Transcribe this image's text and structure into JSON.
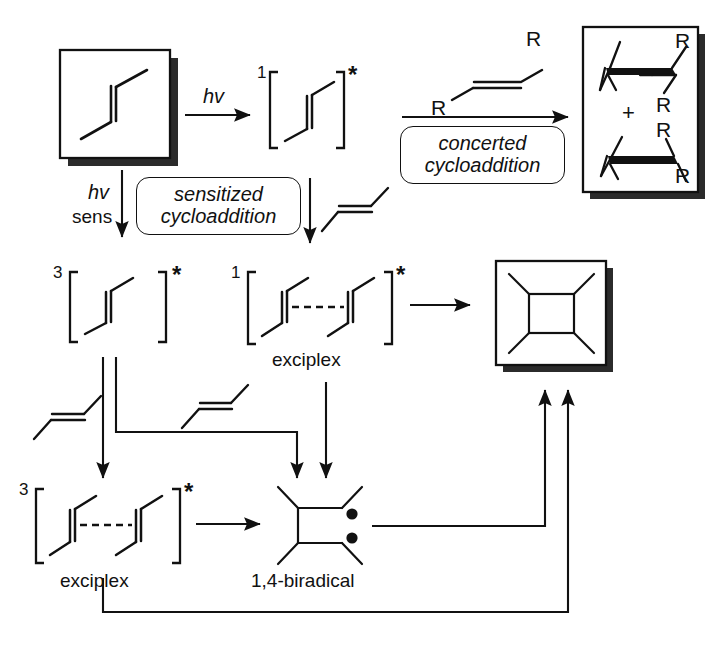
{
  "scheme": {
    "title": "Photochemical [2+2] cycloaddition mechanism",
    "ink_color": "#111111",
    "background_color": "#ffffff"
  },
  "labels": {
    "hv_direct": "hv",
    "hv_sens_top": "hv",
    "hv_sens_bottom": "sens",
    "multiplicity_singlet_excited": "1",
    "multiplicity_triplet_excited": "3",
    "multiplicity_singlet_exciplex": "1",
    "multiplicity_triplet_exciplex": "3",
    "excited_star": "*",
    "plus_sign": "+",
    "r_group": "R",
    "exciplex_singlet_caption": "exciplex",
    "exciplex_triplet_caption": "exciplex",
    "biradical_caption": "1,4-biradical"
  },
  "callout_boxes": [
    {
      "name": "sensitized-cycloaddition",
      "line1": "sensitized",
      "line2": "cycloaddition"
    },
    {
      "name": "concerted-cycloaddition",
      "line1": "concerted",
      "line2": "cycloaddition"
    }
  ],
  "structures": {
    "starting_alkene": "2-butene (cis alkene) in shadow box",
    "singlet_excited_alkene": "1[alkene]*",
    "triplet_excited_alkene": "3[alkene]*",
    "singlet_exciplex": "1[alkene---alkene]*",
    "triplet_exciplex": "3[alkene---alkene]*",
    "biradical": "1,4-biradical with two radical dots",
    "cyclobutane_product": "cyclobutane in shadow box",
    "cyclobutane_stereoisomers": "cis and trans R-substituted cyclobutanes in shadow box",
    "reagent_alkene_r": "trans-alkene bearing two R groups"
  },
  "radical_dots": {
    "count": 2,
    "color": "#111111"
  }
}
